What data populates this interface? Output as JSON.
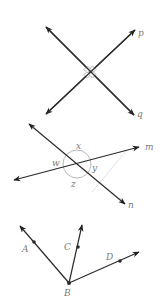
{
  "figure1": {
    "title": "Perpendicular lines p and q",
    "labels": {
      "p": "p",
      "q": "q"
    },
    "intersection": [
      90,
      72
    ],
    "line_p": {
      "from": [
        46,
        114
      ],
      "to": [
        135,
        30
      ]
    },
    "line_q": {
      "from": [
        46,
        27
      ],
      "to": [
        134,
        115
      ]
    },
    "right_angle_marks": 4
  },
  "figure2": {
    "title": "Intersecting lines m and n with angles w, x, y, z",
    "labels": {
      "m": "m",
      "n": "n",
      "w": "w",
      "x": "x",
      "y": "y",
      "z": "z"
    },
    "intersection": [
      77,
      164
    ],
    "line_m": {
      "from": [
        14,
        180
      ],
      "to": [
        139,
        147
      ]
    },
    "line_n": {
      "from": [
        29,
        124
      ],
      "to": [
        125,
        204
      ]
    },
    "angle_circle_radius": 14
  },
  "figure3": {
    "title": "Rays BA, BC, BD from vertex B",
    "labels": {
      "A": "A",
      "B": "B",
      "C": "C",
      "D": "D"
    },
    "vertex_B": [
      69,
      283
    ],
    "ray_BA": {
      "tip": [
        20,
        226
      ],
      "point": [
        34,
        242
      ]
    },
    "ray_BC": {
      "tip": [
        82,
        225
      ],
      "point": [
        78,
        247
      ]
    },
    "ray_BD": {
      "tip": [
        139,
        252
      ],
      "point": [
        120,
        261
      ]
    }
  },
  "colors": {
    "line": "#2b2b2b",
    "label": "#7a7a7a",
    "circle": "#b8b8b8",
    "faint": "#e2e2e2"
  }
}
